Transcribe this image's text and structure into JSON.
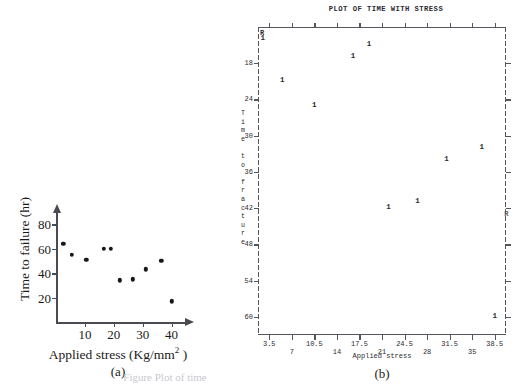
{
  "figure": {
    "bottom_caption": "Figure  Plot of time"
  },
  "panel_a": {
    "caption": "(a)",
    "ylabel": "Time to failure (hr)",
    "xlabel_main": "Applied stress (Kg/mm",
    "xlabel_sup": "2",
    "xlabel_tail": " )",
    "yticks": [
      "20",
      "40",
      "60",
      "80"
    ],
    "xticks": [
      "10",
      "20",
      "30",
      "40"
    ]
  },
  "panel_b": {
    "title": "PLOT OF TIME WITH STRESS",
    "caption": "(b)",
    "xlabel": "Applied stress",
    "ylabel_chars": [
      "T",
      "i",
      "m",
      "e",
      "",
      "t",
      "o",
      "",
      "f",
      "r",
      "a",
      "c",
      "t",
      "u",
      "r",
      "e"
    ],
    "corner_marker": "R",
    "right_marker": "R",
    "point_glyph": "1",
    "yticks": [
      "60",
      "54",
      "48",
      "42",
      "36",
      "30",
      "24",
      "18"
    ],
    "xticks": [
      "3.5",
      "7",
      "10.5",
      "14",
      "17.5",
      "21",
      "24.5",
      "28",
      "31.5",
      "35",
      "38.5"
    ]
  },
  "chart_data": [
    {
      "type": "scatter",
      "panel": "(a)",
      "title": "",
      "xlabel": "Applied stress (Kg/mm2)",
      "ylabel": "Time to failure (hr)",
      "xlim": [
        0,
        45
      ],
      "ylim": [
        0,
        90
      ],
      "xticks": [
        10,
        20,
        30,
        40
      ],
      "yticks": [
        20,
        40,
        60,
        80
      ],
      "grid": false,
      "legend": "none",
      "x": [
        2.5,
        5.5,
        10.5,
        16.5,
        19.0,
        22.0,
        26.5,
        31.0,
        36.5,
        40.0,
        40.0
      ],
      "y": [
        64,
        55,
        51,
        60,
        60,
        34,
        35,
        43,
        50,
        17,
        17
      ],
      "points": [
        {
          "x": 2.5,
          "y": 64
        },
        {
          "x": 5.5,
          "y": 55
        },
        {
          "x": 10.5,
          "y": 51
        },
        {
          "x": 16.5,
          "y": 60
        },
        {
          "x": 19.0,
          "y": 60
        },
        {
          "x": 22.0,
          "y": 34
        },
        {
          "x": 26.5,
          "y": 35
        },
        {
          "x": 31.0,
          "y": 43
        },
        {
          "x": 36.5,
          "y": 50
        },
        {
          "x": 40.0,
          "y": 17
        }
      ]
    },
    {
      "type": "scatter",
      "panel": "(b)",
      "title": "PLOT OF TIME WITH STRESS",
      "xlabel": "Applied stress",
      "ylabel": "Time to fracture",
      "xlim": [
        1.75,
        40.25
      ],
      "ylim": [
        15,
        66
      ],
      "xticks": [
        3.5,
        7,
        10.5,
        14,
        17.5,
        21,
        24.5,
        28,
        31.5,
        35,
        38.5
      ],
      "yticks": [
        18,
        24,
        30,
        36,
        42,
        48,
        54,
        60
      ],
      "grid": false,
      "legend": "none",
      "marker": "1",
      "x": [
        2.5,
        5.5,
        10.5,
        16.5,
        19.0,
        22.0,
        26.5,
        31.0,
        36.5,
        40.0
      ],
      "y": [
        64,
        55,
        51,
        60,
        62,
        34,
        35,
        43,
        50,
        17
      ],
      "points": [
        {
          "x": 2.5,
          "y": 64
        },
        {
          "x": 5.5,
          "y": 57
        },
        {
          "x": 10.5,
          "y": 53
        },
        {
          "x": 16.5,
          "y": 61
        },
        {
          "x": 19.0,
          "y": 63
        },
        {
          "x": 22.0,
          "y": 36
        },
        {
          "x": 26.5,
          "y": 37
        },
        {
          "x": 31.0,
          "y": 44
        },
        {
          "x": 36.5,
          "y": 46
        },
        {
          "x": 38.5,
          "y": 18
        }
      ]
    }
  ]
}
